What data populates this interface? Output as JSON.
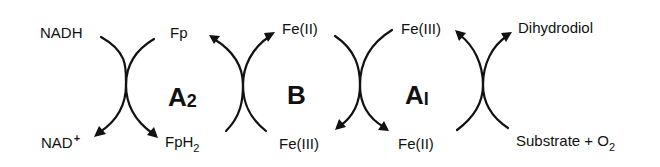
{
  "diagram": {
    "type": "coupled redox reaction scheme",
    "stroke_color": "#111111",
    "background": "#ffffff",
    "cycles": [
      {
        "label_main": "A",
        "label_sub": "2",
        "top_left": "NADH",
        "top_right": "Fp",
        "bottom_left_main": "NAD",
        "bottom_left_sup": "+",
        "bottom_right_main": "FpH",
        "bottom_right_sub": "2"
      },
      {
        "label_main": "B",
        "top_right": "Fe(II)",
        "bottom_right": "Fe(III)"
      },
      {
        "label_main": "A",
        "label_sub": "I",
        "top_left": "Fe(III)",
        "bottom_left": "Fe(II)",
        "top_right": "Dihydrodiol",
        "bottom_right_main": "Substrate + O",
        "bottom_right_sub": "2"
      }
    ]
  }
}
